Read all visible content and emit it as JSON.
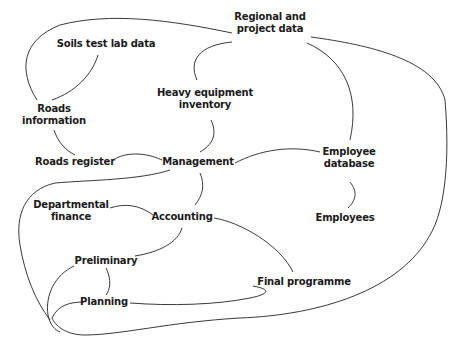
{
  "diagram": {
    "type": "concept-map",
    "nodes": [
      {
        "id": "regional",
        "label_line1": "Regional and",
        "label_line2": "project data"
      },
      {
        "id": "soils",
        "label_line1": "Soils test lab data"
      },
      {
        "id": "heavy",
        "label_line1": "Heavy equipment",
        "label_line2": "inventory"
      },
      {
        "id": "roadsinfo",
        "label_line1": "Roads",
        "label_line2": "information"
      },
      {
        "id": "roadsreg",
        "label_line1": "Roads register"
      },
      {
        "id": "management",
        "label_line1": "Management"
      },
      {
        "id": "empdb",
        "label_line1": "Employee",
        "label_line2": "database"
      },
      {
        "id": "deptfin",
        "label_line1": "Departmental",
        "label_line2": "finance"
      },
      {
        "id": "accounting",
        "label_line1": "Accounting"
      },
      {
        "id": "employees",
        "label_line1": "Employees"
      },
      {
        "id": "preliminary",
        "label_line1": "Preliminary"
      },
      {
        "id": "finalprog",
        "label_line1": "Final programme"
      },
      {
        "id": "planning",
        "label_line1": "Planning"
      }
    ],
    "edges": [
      [
        "roadsinfo",
        "regional"
      ],
      [
        "soils",
        "roadsinfo"
      ],
      [
        "heavy",
        "regional"
      ],
      [
        "regional",
        "empdb"
      ],
      [
        "regional",
        "planning"
      ],
      [
        "roadsinfo",
        "roadsreg"
      ],
      [
        "roadsreg",
        "management"
      ],
      [
        "heavy",
        "management"
      ],
      [
        "management",
        "empdb"
      ],
      [
        "management",
        "planning"
      ],
      [
        "management",
        "accounting"
      ],
      [
        "empdb",
        "employees"
      ],
      [
        "deptfin",
        "accounting"
      ],
      [
        "accounting",
        "preliminary"
      ],
      [
        "accounting",
        "finalprog"
      ],
      [
        "preliminary",
        "planning"
      ],
      [
        "preliminary",
        "planning-loop"
      ],
      [
        "planning",
        "finalprog"
      ]
    ]
  }
}
